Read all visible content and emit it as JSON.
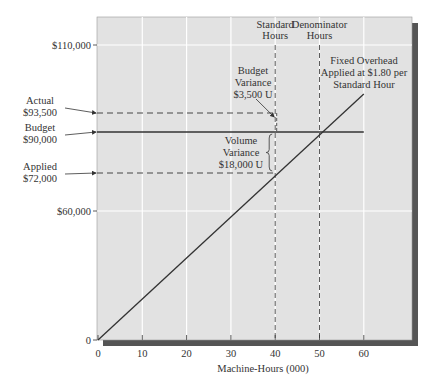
{
  "chart_data": {
    "type": "line",
    "title": "",
    "xlabel": "Machine-Hours (000)",
    "ylabel": "",
    "xlim": [
      0,
      70
    ],
    "x_ticks": [
      0,
      10,
      20,
      30,
      40,
      50,
      60
    ],
    "x_tick_labels": [
      "0",
      "10",
      "20",
      "30",
      "40",
      "50",
      "60"
    ],
    "y_ticks": [
      0,
      60000,
      110000
    ],
    "y_tick_labels": [
      "0",
      "$60,000",
      "$110,000"
    ],
    "grid": true,
    "series": [
      {
        "name": "Fixed Overhead Applied at $1.80 per Standard Hour",
        "style": "solid",
        "x": [
          0,
          60
        ],
        "y": [
          0,
          108000
        ]
      },
      {
        "name": "Budget",
        "style": "solid",
        "x": [
          0,
          60
        ],
        "y": [
          90000,
          90000
        ]
      },
      {
        "name": "Actual",
        "style": "dashed",
        "x": [
          0,
          40
        ],
        "y": [
          93500,
          93500
        ]
      },
      {
        "name": "Applied",
        "style": "dashed",
        "x": [
          0,
          40
        ],
        "y": [
          72000,
          72000
        ]
      }
    ],
    "reference_lines": [
      {
        "name": "Standard Hours",
        "axis": "x",
        "value": 40,
        "style": "dashed",
        "label_lines": [
          "Standard",
          "Hours"
        ]
      },
      {
        "name": "Denominator Hours",
        "axis": "x",
        "value": 50,
        "style": "dashed",
        "label_lines": [
          "Denominator",
          "Hours"
        ]
      }
    ],
    "left_callouts": [
      {
        "name": "actual",
        "label_lines": [
          "Actual",
          "$93,500"
        ],
        "value": 93500
      },
      {
        "name": "budget",
        "label_lines": [
          "Budget",
          "$90,000"
        ],
        "value": 90000
      },
      {
        "name": "applied",
        "label_lines": [
          "Applied",
          "$72,000"
        ],
        "value": 72000
      }
    ],
    "annotations": [
      {
        "name": "budget-variance",
        "label_lines": [
          "Budget",
          "Variance",
          "$3,500 U"
        ],
        "from": 90000,
        "to": 93500,
        "amount": 3500,
        "type": "U"
      },
      {
        "name": "volume-variance",
        "label_lines": [
          "Volume",
          "Variance",
          "$18,000 U"
        ],
        "from": 72000,
        "to": 90000,
        "amount": 18000,
        "type": "U"
      },
      {
        "name": "applied-rate",
        "label_lines": [
          "Fixed Overhead",
          "Applied at $1.80 per",
          "Standard Hour"
        ],
        "rate": 1.8
      }
    ]
  },
  "colors": {
    "plot_background": "#e2e2e2",
    "grid": "#ffffff",
    "shadow": "#555555",
    "line": "#333333",
    "text": "#333333"
  }
}
